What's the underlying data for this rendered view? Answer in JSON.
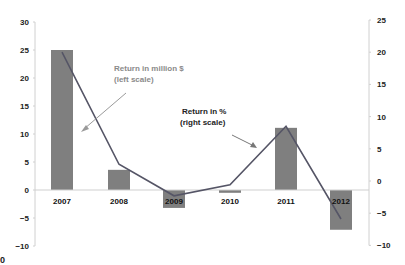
{
  "chart_data": {
    "type": "bar",
    "combo": "bar + line (dual axis)",
    "title": "",
    "xlabel": "",
    "categories": [
      "2007",
      "2008",
      "2009",
      "2010",
      "2011",
      "2012"
    ],
    "series": [
      {
        "name": "Return in million $",
        "type": "bar",
        "axis": "left",
        "color": "#7f7f7f",
        "values": [
          25,
          3.6,
          -3.2,
          -0.5,
          11.1,
          -7.1
        ]
      },
      {
        "name": "Return in %",
        "type": "line",
        "axis": "right",
        "color": "#555566",
        "values": [
          20,
          2.6,
          -2.3,
          -0.6,
          8.5,
          -5.9
        ]
      }
    ],
    "left_axis": {
      "ylim": [
        -10,
        30
      ],
      "ticks": [
        "30",
        "25",
        "20",
        "15",
        "10",
        "5",
        "0",
        "−10"
      ],
      "tick_values": [
        30,
        25,
        20,
        15,
        10,
        5,
        0,
        -5,
        -10
      ],
      "tick_labels": [
        "30",
        "25",
        "20",
        "15",
        "10",
        "5",
        "0",
        "−5",
        "−10"
      ]
    },
    "right_axis": {
      "ylim": [
        -10,
        25
      ],
      "tick_values": [
        25,
        20,
        15,
        10,
        5,
        0,
        -5,
        -10
      ],
      "tick_labels": [
        "25",
        "20",
        "15",
        "10",
        "5",
        "0",
        "−5",
        "−10"
      ]
    },
    "annotations": [
      {
        "text_line1": "Return in million $",
        "text_line2": "(left scale)",
        "color": "#8a8a8a"
      },
      {
        "text_line1": "Return in %",
        "text_line2": "(right scale)",
        "color": "#222222"
      }
    ],
    "grid": false,
    "legend": "none (inline annotations)"
  },
  "corner_text": "0"
}
